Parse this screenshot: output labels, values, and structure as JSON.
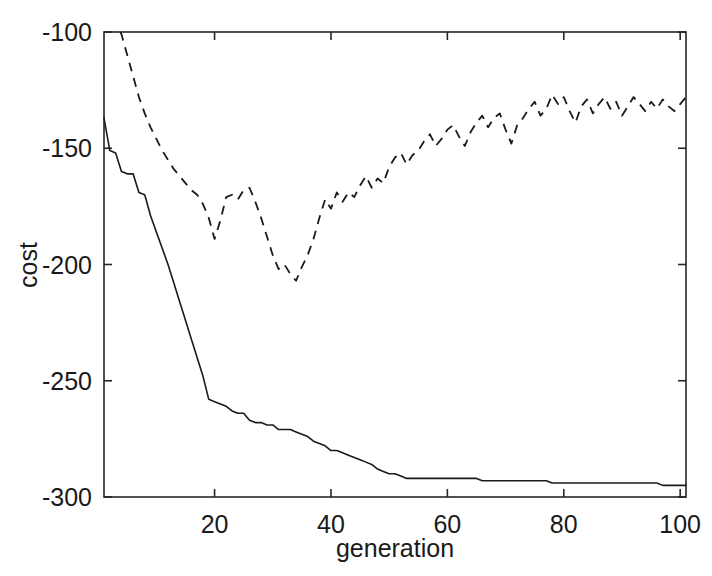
{
  "chart_data": {
    "type": "line",
    "title": "",
    "xlabel": "generation",
    "ylabel": "cost",
    "xlim": [
      1,
      101
    ],
    "ylim": [
      -300,
      -100
    ],
    "grid": false,
    "legend": "none",
    "xticks": [
      20,
      40,
      60,
      80,
      100
    ],
    "xtick_labels": [
      "20",
      "40",
      "60",
      "80",
      "100"
    ],
    "yticks": [
      -300,
      -250,
      -200,
      -150,
      -100
    ],
    "ytick_labels": [
      "-300",
      "-250",
      "-200",
      "-150",
      "-100"
    ],
    "x": [
      1,
      2,
      3,
      4,
      5,
      6,
      7,
      8,
      9,
      10,
      11,
      12,
      13,
      14,
      15,
      16,
      17,
      18,
      19,
      20,
      21,
      22,
      23,
      24,
      25,
      26,
      27,
      28,
      29,
      30,
      31,
      32,
      33,
      34,
      35,
      36,
      37,
      38,
      39,
      40,
      41,
      42,
      43,
      44,
      45,
      46,
      47,
      48,
      49,
      50,
      51,
      52,
      53,
      54,
      55,
      56,
      57,
      58,
      59,
      60,
      61,
      62,
      63,
      64,
      65,
      66,
      67,
      68,
      69,
      70,
      71,
      72,
      73,
      74,
      75,
      76,
      77,
      78,
      79,
      80,
      81,
      82,
      83,
      84,
      85,
      86,
      87,
      88,
      89,
      90,
      91,
      92,
      93,
      94,
      95,
      96,
      97,
      98,
      99,
      100,
      101
    ],
    "series": [
      {
        "name": "best cost",
        "style": "solid",
        "values": [
          -137,
          -151,
          -152,
          -160,
          -161,
          -161,
          -169,
          -170,
          -179,
          -186,
          -193,
          -200,
          -208,
          -216,
          -224,
          -232,
          -240,
          -248,
          -258,
          -259,
          -260,
          -261,
          -263,
          -264,
          -264,
          -267,
          -268,
          -268,
          -269,
          -269,
          -271,
          -271,
          -271,
          -272,
          -273,
          -274,
          -276,
          -277,
          -278,
          -280,
          -280,
          -281,
          -282,
          -283,
          -284,
          -285,
          -286,
          -288,
          -289,
          -290,
          -290,
          -291,
          -292,
          -292,
          -292,
          -292,
          -292,
          -292,
          -292,
          -292,
          -292,
          -292,
          -292,
          -292,
          -292,
          -293,
          -293,
          -293,
          -293,
          -293,
          -293,
          -293,
          -293,
          -293,
          -293,
          -293,
          -293,
          -294,
          -294,
          -294,
          -294,
          -294,
          -294,
          -294,
          -294,
          -294,
          -294,
          -294,
          -294,
          -294,
          -294,
          -294,
          -294,
          -294,
          -294,
          -294,
          -295,
          -295,
          -295,
          -295,
          -295
        ]
      },
      {
        "name": "average cost",
        "style": "dashed",
        "values": [
          -85,
          -90,
          -96,
          -101,
          -110,
          -119,
          -128,
          -135,
          -141,
          -146,
          -151,
          -155,
          -159,
          -162,
          -165,
          -168,
          -170,
          -174,
          -180,
          -189,
          -181,
          -171,
          -170,
          -172,
          -168,
          -167,
          -173,
          -180,
          -188,
          -196,
          -202,
          -200,
          -204,
          -207,
          -201,
          -196,
          -189,
          -180,
          -172,
          -176,
          -169,
          -173,
          -169,
          -171,
          -166,
          -162,
          -167,
          -163,
          -165,
          -158,
          -154,
          -152,
          -157,
          -153,
          -151,
          -147,
          -144,
          -149,
          -146,
          -142,
          -140,
          -145,
          -149,
          -143,
          -139,
          -136,
          -141,
          -137,
          -135,
          -142,
          -148,
          -140,
          -137,
          -133,
          -130,
          -136,
          -133,
          -127,
          -131,
          -128,
          -134,
          -139,
          -132,
          -129,
          -135,
          -131,
          -128,
          -133,
          -130,
          -136,
          -132,
          -128,
          -131,
          -134,
          -130,
          -133,
          -129,
          -132,
          -134,
          -131,
          -128
        ]
      }
    ]
  },
  "axis": {
    "ylabel": "cost",
    "xlabel": "generation"
  }
}
